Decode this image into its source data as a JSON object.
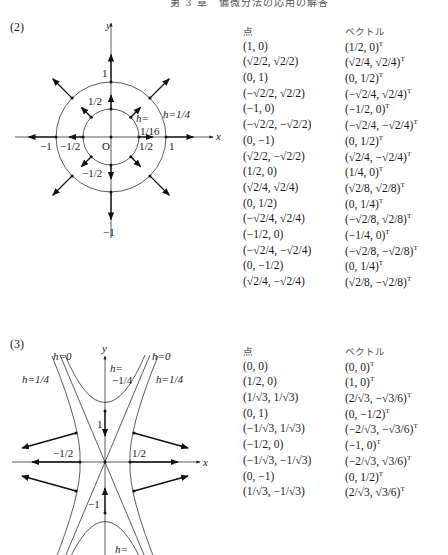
{
  "header": {
    "page_number": "",
    "title": "第 3 章　偏微分法の応用の解答"
  },
  "section2": {
    "label": "(2)",
    "diagram": {
      "axis_x_label": "x",
      "axis_y_label": "y",
      "origin_label": "O",
      "tick_labels": {
        "x_pos_1": "1",
        "x_neg_1": "−1",
        "x_pos_half": "1/2",
        "x_neg_half": "−1/2",
        "y_pos_1": "1",
        "y_neg_1": "−1",
        "y_pos_half": "1/2",
        "y_neg_half": "−1/2"
      },
      "level_labels": {
        "outer": "h=1/4",
        "inner_line1": "h=",
        "inner_line2": "1/16"
      }
    },
    "table": {
      "headers": {
        "point": "点",
        "vector": "ベクトル"
      },
      "rows": [
        {
          "point": "(1, 0)",
          "vector": "(1/2, 0)"
        },
        {
          "point": "(√2/2, √2/2)",
          "vector": "(√2/4, √2/4)"
        },
        {
          "point": "(0, 1)",
          "vector": "(0, 1/2)"
        },
        {
          "point": "(−√2/2, √2/2)",
          "vector": "(−√2/4, √2/4)"
        },
        {
          "point": "(−1, 0)",
          "vector": "(−1/2, 0)"
        },
        {
          "point": "(−√2/2, −√2/2)",
          "vector": "(−√2/4, −√2/4)"
        },
        {
          "point": "(0, −1)",
          "vector": "(0, 1/2)"
        },
        {
          "point": "(√2/2, −√2/2)",
          "vector": "(√2/4, −√2/4)"
        },
        {
          "point": "(1/2, 0)",
          "vector": "(1/4, 0)"
        },
        {
          "point": "(√2/4, √2/4)",
          "vector": "(√2/8, √2/8)"
        },
        {
          "point": "(0, 1/2)",
          "vector": "(0, 1/4)"
        },
        {
          "point": "(−√2/4, √2/4)",
          "vector": "(−√2/8, √2/8)"
        },
        {
          "point": "(−1/2, 0)",
          "vector": "(−1/4, 0)"
        },
        {
          "point": "(−√2/4, −√2/4)",
          "vector": "(−√2/8, −√2/8)"
        },
        {
          "point": "(0, −1/2)",
          "vector": "(0, 1/4)"
        },
        {
          "point": "(√2/4, −√2/4)",
          "vector": "(√2/8, −√2/8)"
        }
      ],
      "transpose_mark": "T"
    }
  },
  "section3": {
    "label": "(3)",
    "diagram": {
      "axis_x_label": "x",
      "axis_y_label": "y",
      "tick_labels": {
        "y_pos_1": "1",
        "y_neg_1": "−1",
        "x_pos_half": "1/2",
        "x_neg_half": "−1/2"
      },
      "level_labels": {
        "h0_left": "h=0",
        "h0_right": "h=0",
        "h_quarter_left": "h=1/4",
        "h_quarter_right": "h=1/4",
        "h_neg_quarter_line1": "h=",
        "h_neg_quarter_line2": "−1/4",
        "bottom_line1": "h="
      }
    },
    "table": {
      "headers": {
        "point": "点",
        "vector": "ベクトル"
      },
      "rows": [
        {
          "point": "(0, 0)",
          "vector": "(0, 0)"
        },
        {
          "point": "(1/2, 0)",
          "vector": "(1, 0)"
        },
        {
          "point": "(1/√3, 1/√3)",
          "vector": "(2/√3, −√3/6)"
        },
        {
          "point": "(0, 1)",
          "vector": "(0, −1/2)"
        },
        {
          "point": "(−1/√3, 1/√3)",
          "vector": "(−2/√3, −√3/6)"
        },
        {
          "point": "(−1/2, 0)",
          "vector": "(−1, 0)"
        },
        {
          "point": "(−1/√3, −1/√3)",
          "vector": "(−2/√3, √3/6)"
        },
        {
          "point": "(0, −1)",
          "vector": "(0, 1/2)"
        },
        {
          "point": "(1/√3, −1/√3)",
          "vector": "(2/√3, √3/6)"
        }
      ],
      "transpose_mark": "T"
    }
  }
}
